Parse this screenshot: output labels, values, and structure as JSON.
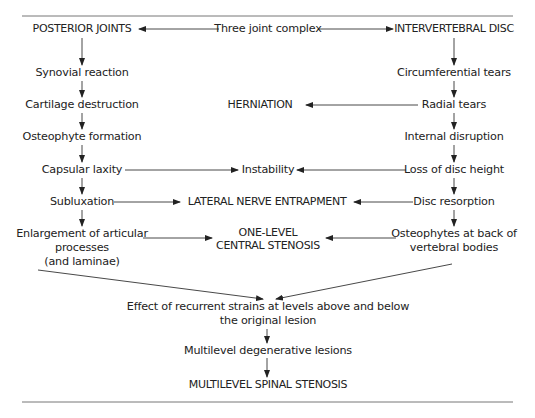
{
  "diagram": {
    "colors": {
      "text": "#222222",
      "line": "#333333",
      "rule": "#777777"
    },
    "header": {
      "left": "POSTERIOR JOINTS",
      "center": "Three joint complex",
      "right": "INTERVERTEBRAL DISC"
    },
    "left_column": [
      "Synovial reaction",
      "Cartilage destruction",
      "Osteophyte formation",
      "Capsular laxity",
      "Subluxation",
      "Enlargement of articular",
      "processes",
      "(and laminae)"
    ],
    "right_column": [
      "Circumferential tears",
      "Radial tears",
      "Internal disruption",
      "Loss of disc height",
      "Disc resorption",
      "Osteophytes at back of",
      "vertebral bodies"
    ],
    "center_nodes": {
      "herniation": "HERNIATION",
      "instability": "Instability",
      "lateral_nerve": "LATERAL NERVE ENTRAPMENT",
      "one_level_1": "ONE-LEVEL",
      "one_level_2": "CENTRAL STENOSIS"
    },
    "bottom": {
      "effect_1": "Effect of recurrent strains at levels above and below",
      "effect_2": "the original lesion",
      "multilevel_lesions": "Multilevel degenerative lesions",
      "final": "MULTILEVEL SPINAL STENOSIS"
    }
  }
}
